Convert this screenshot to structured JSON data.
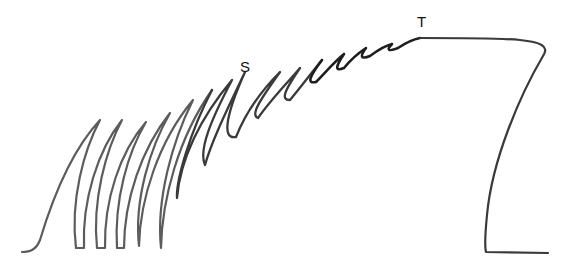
{
  "diagram": {
    "type": "muscle-twitch-summation-to-tetanus",
    "labels": {
      "summation": "S",
      "tetanus": "T"
    },
    "colors": {
      "trace_light": "#5a5a5a",
      "trace_dark": "#1e1e1e",
      "background": "#ffffff"
    }
  }
}
